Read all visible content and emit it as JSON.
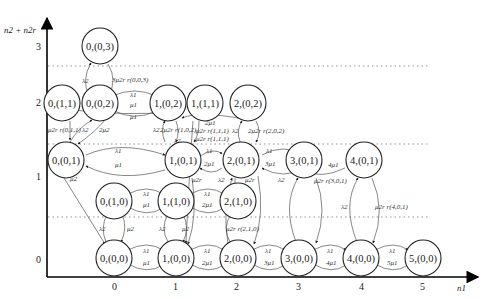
{
  "diagram": {
    "type": "state-transition-diagram",
    "axes": {
      "x_title": "n1",
      "y_title": "n2 + n2r",
      "x_ticks": [
        "0",
        "1",
        "2",
        "3",
        "4",
        "5"
      ],
      "y_ticks": [
        "0",
        "1",
        "2",
        "3"
      ]
    },
    "nodes": [
      {
        "id": "0,(0,3)",
        "label": "0,(0,3)"
      },
      {
        "id": "0,(1,1)",
        "label": "0,(1,1)"
      },
      {
        "id": "0,(0,2)",
        "label": "0,(0,2)"
      },
      {
        "id": "1,(0,2)",
        "label": "1,(0,2)"
      },
      {
        "id": "1,(1,1)",
        "label": "1,(1,1)"
      },
      {
        "id": "2,(0,2)",
        "label": "2,(0,2)"
      },
      {
        "id": "0,(0,1)",
        "label": "0,(0,1)"
      },
      {
        "id": "1,(0,1)",
        "label": "1,(0,1)"
      },
      {
        "id": "2,(0,1)",
        "label": "2,(0,1)"
      },
      {
        "id": "3,(0,1)",
        "label": "3,(0,1)"
      },
      {
        "id": "4,(0,1)",
        "label": "4,(0,1)"
      },
      {
        "id": "0,(1,0)",
        "label": "0,(1,0)"
      },
      {
        "id": "1,(1,0)",
        "label": "1,(1,0)"
      },
      {
        "id": "2,(1,0)",
        "label": "2,(1,0)"
      },
      {
        "id": "0,(0,0)",
        "label": "0,(0,0)"
      },
      {
        "id": "1,(0,0)",
        "label": "1,(0,0)"
      },
      {
        "id": "2,(0,0)",
        "label": "2,(0,0)"
      },
      {
        "id": "3,(0,0)",
        "label": "3,(0,0)"
      },
      {
        "id": "4,(0,0)",
        "label": "4,(0,0)"
      },
      {
        "id": "5,(0,0)",
        "label": "5,(0,0)"
      }
    ],
    "edge_labels": {
      "l1": "λ1",
      "l2": "λ2",
      "mu1": "μ1",
      "two_mu1": "2μ1",
      "three_mu1": "3μ1",
      "four_mu1": "4μ1",
      "five_mu1": "5μ1",
      "mu2": "μ2",
      "two_mu2": "2μ2",
      "mu2r": "μ2r",
      "three_mu2r_003": "3μ2r r(0,0,3)",
      "mu2r_011": "μ2r r(0,1,1)",
      "two_mu2r_102": "2μ2r r(1,0,2)",
      "mu2r_111a": "μ2r r(1,1,1)",
      "mu2r_111b": "μ2r r(1,1,1)",
      "two_mu2r_202": "2μ2r r(2,0,2)",
      "mu2r_210": "μ2r r(2,1,0)",
      "mu2r_301": "μ2r r(3,0,1)",
      "mu2r_401": "μ2r r(4,0,1)"
    }
  }
}
